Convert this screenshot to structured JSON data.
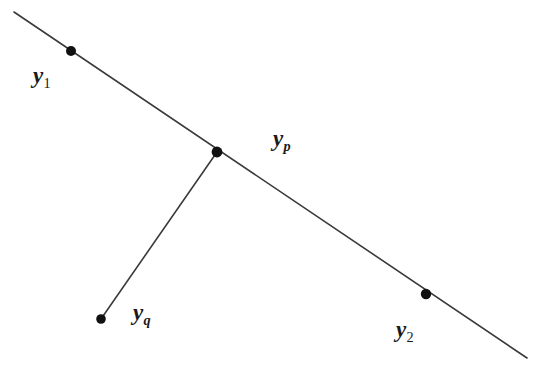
{
  "figure": {
    "background_color": "#ffffff",
    "line_color": "#3a3a3a",
    "dot_color": "#111111",
    "label_color": "#1a1a1a"
  },
  "labels": {
    "y1": {
      "base": "y",
      "sub": "1"
    },
    "yp": {
      "base": "y",
      "sub": "p"
    },
    "yq": {
      "base": "y",
      "sub": "q"
    },
    "y2": {
      "base": "y",
      "sub": "2"
    }
  },
  "chart_data": {
    "type": "scatter",
    "title": "",
    "xlabel": "",
    "ylabel": "",
    "xlim": [
      0,
      548
    ],
    "ylim": [
      0,
      376
    ],
    "grid": false,
    "legend": "none",
    "coordinate_system": "pixel (origin top-left, y increases downward)",
    "points": [
      {
        "name": "y1",
        "label": "y_1",
        "x": 71,
        "y": 51,
        "on_segment": "main-line"
      },
      {
        "name": "yp",
        "label": "y_p",
        "x": 217,
        "y": 152,
        "on_segment": "main-line/branch-junction"
      },
      {
        "name": "y2",
        "label": "y_2",
        "x": 426,
        "y": 294,
        "on_segment": "main-line"
      },
      {
        "name": "yq",
        "label": "y_q",
        "x": 101,
        "y": 319,
        "on_segment": "branch-endpoint"
      }
    ],
    "segments": [
      {
        "name": "main-line",
        "x": [
          14,
          527
        ],
        "y": [
          12,
          358
        ],
        "passes_through": [
          "y1",
          "yp",
          "y2"
        ]
      },
      {
        "name": "branch-line",
        "x": [
          217,
          101
        ],
        "y": [
          152,
          319
        ],
        "passes_through": [
          "yp",
          "yq"
        ]
      }
    ],
    "label_positions": [
      {
        "name": "y1",
        "x": 44,
        "y": 76
      },
      {
        "name": "yp",
        "x": 288,
        "y": 140
      },
      {
        "name": "yq",
        "x": 148,
        "y": 314
      },
      {
        "name": "y2",
        "x": 410,
        "y": 332
      }
    ]
  }
}
